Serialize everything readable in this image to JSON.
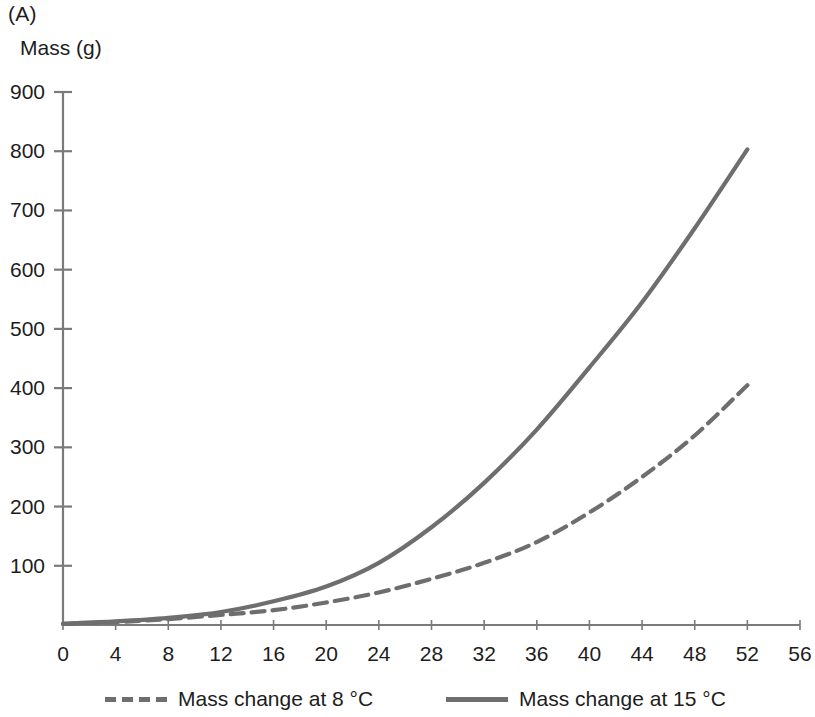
{
  "panel": {
    "label": "(A)"
  },
  "chart_data": {
    "type": "line",
    "title": "",
    "panel_label": "(A)",
    "ylabel": "Mass (g)",
    "xlabel": "",
    "xlim": [
      0,
      56
    ],
    "ylim": [
      0,
      900
    ],
    "grid": false,
    "legend_position": "bottom",
    "x_ticks": [
      0,
      4,
      8,
      12,
      16,
      20,
      24,
      28,
      32,
      36,
      40,
      44,
      48,
      52,
      56
    ],
    "y_ticks": [
      100,
      200,
      300,
      400,
      500,
      600,
      700,
      800,
      900
    ],
    "line_color": "#6e6e6e",
    "axis_color": "#7a7a7a",
    "series": [
      {
        "name": "Mass change at 8 °C",
        "style": "dashed",
        "color": "#6e6e6e",
        "x": [
          0,
          4,
          8,
          12,
          16,
          20,
          24,
          28,
          32,
          36,
          40,
          44,
          48,
          52
        ],
        "values": [
          2,
          5,
          10,
          17,
          25,
          38,
          55,
          78,
          105,
          140,
          190,
          250,
          320,
          405
        ]
      },
      {
        "name": "Mass change at 15 °C",
        "style": "solid",
        "color": "#6e6e6e",
        "x": [
          0,
          4,
          8,
          12,
          16,
          20,
          24,
          28,
          32,
          36,
          40,
          44,
          48,
          52
        ],
        "values": [
          2,
          6,
          12,
          22,
          40,
          65,
          105,
          165,
          240,
          330,
          435,
          545,
          670,
          803
        ]
      }
    ]
  },
  "legend": {
    "items": [
      {
        "label": "Mass change at 8 °C",
        "style": "dashed"
      },
      {
        "label": "Mass change at 15 °C",
        "style": "solid"
      }
    ]
  }
}
